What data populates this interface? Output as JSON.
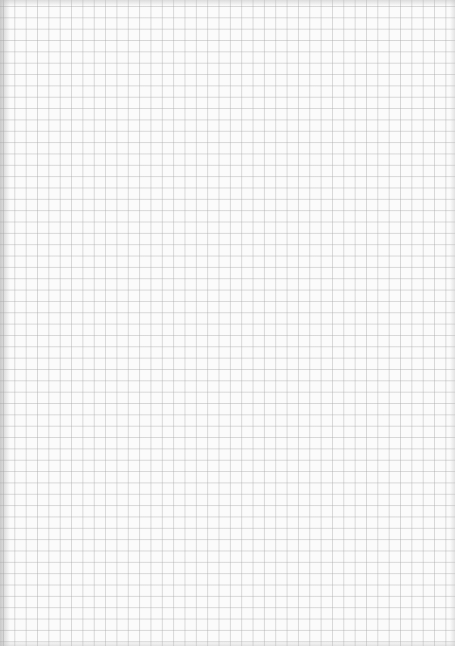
{
  "page": {
    "type": "graph-paper",
    "grid_color": "#c8c8c8",
    "paper_color": "#fbfbfb",
    "grid_cell_px": 11.35
  }
}
